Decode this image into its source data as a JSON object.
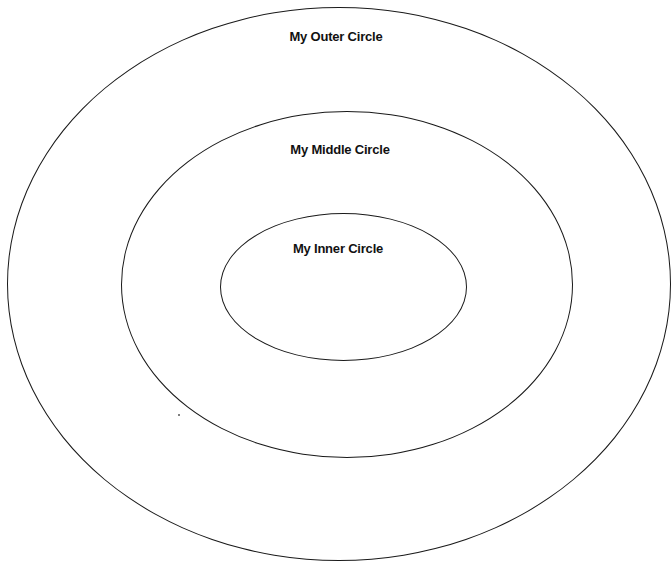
{
  "diagram": {
    "type": "concentric-ellipses",
    "background": "#ffffff",
    "stroke_color": "#1a1a1a",
    "circles": [
      {
        "id": "outer",
        "label": "My Outer Circle",
        "center": [
          339,
          284
        ],
        "rx": 332,
        "ry": 277
      },
      {
        "id": "middle",
        "label": "My Middle Circle",
        "center": [
          347,
          284
        ],
        "rx": 226,
        "ry": 173
      },
      {
        "id": "inner",
        "label": "My Inner Circle",
        "center": [
          343,
          287
        ],
        "rx": 123,
        "ry": 74
      }
    ]
  }
}
